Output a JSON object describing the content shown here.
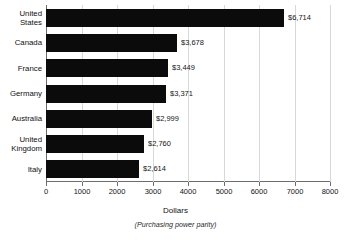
{
  "chart_data": {
    "type": "bar",
    "orientation": "horizontal",
    "title": "",
    "xlabel": "Dollars",
    "xsublabel": "(Purchasing power parity)",
    "ylabel": "",
    "xlim": [
      0,
      8000
    ],
    "xticks": [
      0,
      1000,
      2000,
      3000,
      4000,
      5000,
      6000,
      7000,
      8000
    ],
    "xticklabels": [
      "0",
      "1000",
      "2000",
      "3000",
      "4000",
      "5000",
      "6000",
      "7000",
      "8000"
    ],
    "grid": "vertical",
    "legend": "none",
    "bar_color": "#0b0b0b",
    "categories": [
      "United\nStates",
      "Canada",
      "France",
      "Germany",
      "Australia",
      "United\nKingdom",
      "Italy"
    ],
    "values": [
      6714,
      3678,
      3449,
      3371,
      2999,
      2760,
      2614
    ],
    "value_labels": [
      "$6,714",
      "$3,678",
      "$3,449",
      "$3,371",
      "$2,999",
      "$2,760",
      "$2,614"
    ]
  }
}
